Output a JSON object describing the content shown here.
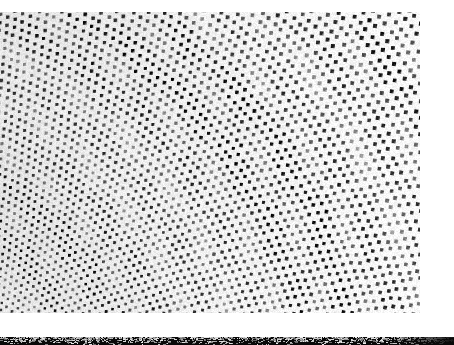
{
  "figure": {
    "kind": "electron-micrograph",
    "title_visible": false,
    "panels": [
      {
        "name": "main-micrograph",
        "x": 0,
        "y": 0,
        "width": 454,
        "height": 316,
        "description": "Radial array of square apertures with moire banding",
        "background": "#ffffff"
      },
      {
        "name": "lower-micrograph-strip",
        "x": 0,
        "y": 337,
        "width": 454,
        "height": 8,
        "description": "Top edge of a second, cropped micrograph panel",
        "background": "#0a0a0a"
      }
    ]
  },
  "palette": {
    "paper_white": "#ffffff",
    "substrate_light": "#f2f2f2",
    "mid_gray": "#9a9a9a",
    "dark_gray": "#4a4a4a",
    "aperture_black": "#141414",
    "strip_black": "#090909"
  },
  "pattern": {
    "type": "radial-square-lattice",
    "center_x": -140,
    "center_y": 470,
    "radial_start": 150,
    "radial_count": 150,
    "radial_spacing_min": 6.2,
    "radial_spacing_max": 13.5,
    "angular_count": 150,
    "angle_start_deg": -92,
    "angle_end_deg": -2,
    "dot_size_min": 2.0,
    "dot_size_max": 5.6,
    "dot_rotation_deg": 14,
    "moire_period": 46,
    "moire_strength": 0.34,
    "noise_amount": 0.22,
    "margin_top": 12,
    "margin_right": 34,
    "content_left": 0,
    "content_bottom": 313
  },
  "lower_strip": {
    "noise_amount": 0.55,
    "speckle_density": 0.3,
    "base": "#090909",
    "highlight": "#cfcfcf"
  }
}
